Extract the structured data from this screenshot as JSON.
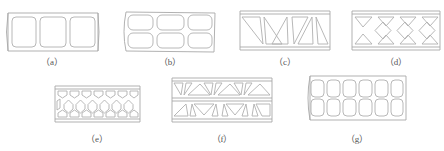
{
  "figure": {
    "line_color": "#a8a8a8",
    "background": "#ffffff",
    "panels": [
      {
        "id": "a",
        "label": "（a）",
        "pattern": "rectangular-cells-1-row",
        "cells": 3
      },
      {
        "id": "b",
        "label": "（b）",
        "pattern": "rectangular-cells-2-rows",
        "cells": 6
      },
      {
        "id": "c",
        "label": "（c）",
        "pattern": "triangular-truss",
        "cells": 6
      },
      {
        "id": "d",
        "label": "（d）",
        "pattern": "diamond-x-lattice",
        "cells": 11
      },
      {
        "id": "e",
        "label": "（e）",
        "pattern": "hexagonal-honeycomb",
        "cells": 19
      },
      {
        "id": "f",
        "label": "（f）",
        "pattern": "double-layer-triangular-truss",
        "cells": 16
      },
      {
        "id": "g",
        "label": "（g）",
        "pattern": "rounded-square-cells-2-rows",
        "cells": 12
      }
    ]
  }
}
